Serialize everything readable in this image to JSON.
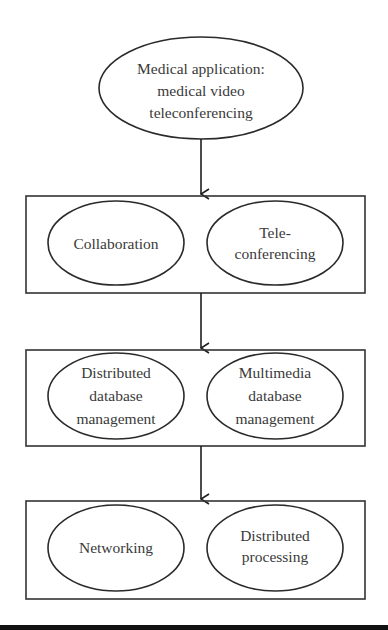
{
  "diagram": {
    "type": "hierarchical flow",
    "top": {
      "lines": [
        "Medical application:",
        "medical video",
        "teleconferencing"
      ]
    },
    "layers": [
      {
        "nodes": [
          {
            "lines": [
              "Collaboration"
            ]
          },
          {
            "lines": [
              "Tele-",
              "conferencing"
            ]
          }
        ]
      },
      {
        "nodes": [
          {
            "lines": [
              "Distributed",
              "database",
              "management"
            ]
          },
          {
            "lines": [
              "Multimedia",
              "database",
              "management"
            ]
          }
        ]
      },
      {
        "nodes": [
          {
            "lines": [
              "Networking"
            ]
          },
          {
            "lines": [
              "Distributed",
              "processing"
            ]
          }
        ]
      }
    ],
    "edges": [
      {
        "from": "top",
        "to": "layer-1"
      },
      {
        "from": "layer-1",
        "to": "layer-2"
      },
      {
        "from": "layer-2",
        "to": "layer-3"
      }
    ],
    "colors": {
      "stroke": "#2a2a2a",
      "text": "#3a3a3a",
      "background": "#ffffff"
    }
  }
}
